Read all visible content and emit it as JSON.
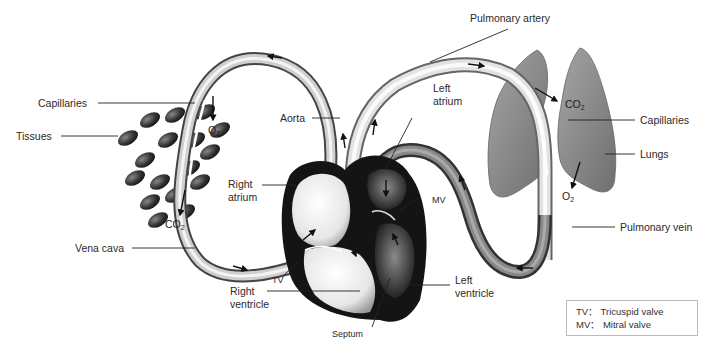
{
  "labels": {
    "pulmonary_artery": "Pulmonary artery",
    "capillaries_left": "Capillaries",
    "tissues": "Tissues",
    "aorta": "Aorta",
    "left_atrium_1": "Left",
    "left_atrium_2": "atrium",
    "right_atrium_1": "Right",
    "right_atrium_2": "atrium",
    "mv": "MV",
    "tv": "TV",
    "vena_cava": "Vena cava",
    "right_ventricle_1": "Right",
    "right_ventricle_2": "ventricle",
    "septum": "Septum",
    "left_ventricle_1": "Left",
    "left_ventricle_2": "ventricle",
    "capillaries_right": "Capillaries",
    "lungs": "Lungs",
    "pulmonary_vein": "Pulmonary vein"
  },
  "gases": {
    "o2_tissue": {
      "base": "O",
      "sub": "2"
    },
    "co2_tissue": {
      "base": "CO",
      "sub": "2"
    },
    "co2_lung": {
      "base": "CO",
      "sub": "2"
    },
    "o2_lung": {
      "base": "O",
      "sub": "2"
    }
  },
  "legend": {
    "line1": "TV： Tricuspid valve",
    "line2": "MV： Mitral valve"
  },
  "colors": {
    "vessel_light": "#d8d8d8",
    "vessel_dark": "#5a5a5a",
    "heart_dark": "#151515",
    "lung": "#8a8a8a"
  }
}
